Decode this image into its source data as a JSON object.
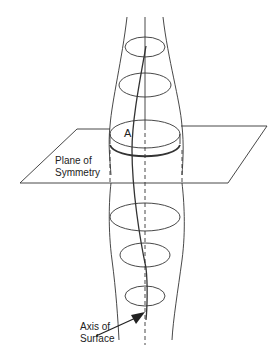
{
  "diagram": {
    "type": "surface-of-revolution-symmetry",
    "labels": {
      "point_a": "A",
      "plane_line1": "Plane of",
      "plane_line2": "Symmetry",
      "axis_line1": "Axis of",
      "axis_line2": "Surface"
    },
    "colors": {
      "stroke": "#222222",
      "background": "#ffffff"
    }
  }
}
